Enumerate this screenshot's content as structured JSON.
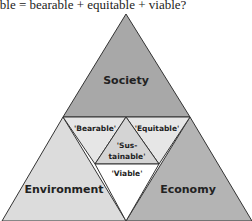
{
  "title": "able = bearable + equitable + viable?",
  "regions": {
    "society": {
      "label": "Society",
      "color": "#a8a8a8"
    },
    "environment": {
      "label": "Environment",
      "color": "#dcdcdc"
    },
    "economy": {
      "label": "Economy",
      "color": "#b4b4b4"
    },
    "bearable": {
      "label": "'Bearable'",
      "color": "#e6e6e6"
    },
    "equitable": {
      "label": "'Equitable'",
      "color": "#e6e6e6"
    },
    "viable": {
      "label": "'Viable'",
      "color": "#ffffff"
    },
    "sustainable": {
      "label_line1": "'Sus-",
      "label_line2": "tainable'",
      "color": "#d4d4d4"
    }
  }
}
